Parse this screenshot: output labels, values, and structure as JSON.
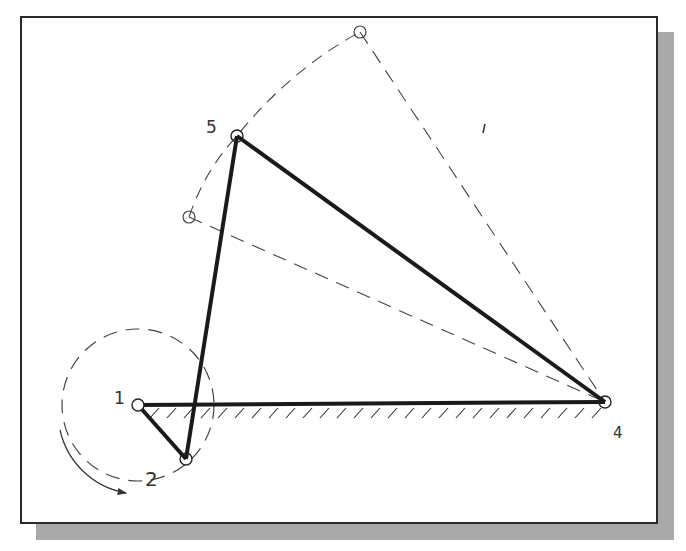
{
  "diagram": {
    "type": "four-bar-linkage",
    "colors": {
      "link": "#1a1a1a",
      "dashed": "#444444",
      "frame_border": "#2a2a2a",
      "shadow": "#a9a9a9",
      "background": "#ffffff"
    },
    "frame": {
      "x": 20,
      "y": 16,
      "width": 638,
      "height": 508
    },
    "shadow": {
      "offset_x": 16,
      "offset_y": 16
    },
    "joints": [
      {
        "id": "1",
        "label": "1",
        "x": 138,
        "y": 405,
        "label_x": 114,
        "label_y": 404
      },
      {
        "id": "2",
        "label": "2",
        "x": 186,
        "y": 459,
        "label_x": 145,
        "label_y": 486
      },
      {
        "id": "4",
        "label": "4",
        "x": 605,
        "y": 402,
        "label_x": 613,
        "label_y": 438
      },
      {
        "id": "5",
        "label": "5",
        "x": 237,
        "y": 136,
        "label_x": 206,
        "label_y": 133
      }
    ],
    "alt_positions": [
      {
        "id": "5a",
        "x": 360,
        "y": 32
      },
      {
        "id": "5b",
        "x": 189,
        "y": 217
      }
    ],
    "links": [
      {
        "name": "ground-link",
        "from": "1",
        "to": "4"
      },
      {
        "name": "crank-link",
        "from": "1",
        "to": "2"
      },
      {
        "name": "coupler-link",
        "from": "2",
        "to": "5"
      },
      {
        "name": "rocker-link",
        "from": "5",
        "to": "4"
      }
    ],
    "crank_circle": {
      "cx": 138,
      "cy": 405,
      "r": 76
    },
    "rotation_label": "2",
    "labels": {
      "joint_1": "1",
      "joint_2": "2",
      "joint_4": "4",
      "joint_5": "5"
    }
  }
}
